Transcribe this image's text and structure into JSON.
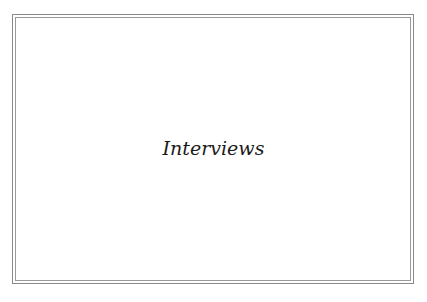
{
  "slide": {
    "title": "Interviews"
  },
  "colors": {
    "background": "#ffffff",
    "frame": "#8a8a8a",
    "text": "#1a1a1a"
  }
}
